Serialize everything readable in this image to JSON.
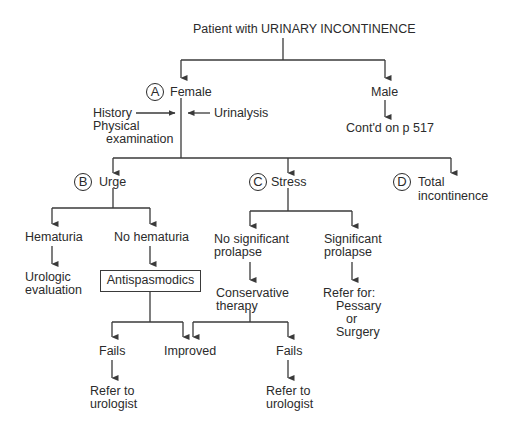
{
  "title": "Patient with URINARY INCONTINENCE",
  "branches": {
    "female": {
      "marker": "A",
      "label": "Female"
    },
    "male": {
      "label": "Male",
      "continued": "Cont'd on p 517"
    }
  },
  "workup": {
    "left_line1": "History",
    "left_line2": "Physical",
    "left_line3": "examination",
    "right": "Urinalysis"
  },
  "types": {
    "urge": {
      "marker": "B",
      "label": "Urge"
    },
    "stress": {
      "marker": "C",
      "label": "Stress"
    },
    "total": {
      "marker": "D",
      "label_line1": "Total",
      "label_line2": "incontinence"
    }
  },
  "urge_path": {
    "hematuria": "Hematuria",
    "hematuria_next_line1": "Urologic",
    "hematuria_next_line2": "evaluation",
    "no_hematuria": "No hematuria",
    "treatment": "Antispasmodics",
    "fails": "Fails",
    "fails_next_line1": "Refer to",
    "fails_next_line2": "urologist"
  },
  "shared": {
    "improved": "Improved"
  },
  "stress_path": {
    "no_prolapse_line1": "No significant",
    "no_prolapse_line2": "prolapse",
    "conservative_line1": "Conservative",
    "conservative_line2": "therapy",
    "prolapse_line1": "Significant",
    "prolapse_line2": "prolapse",
    "refer_line1": "Refer for:",
    "refer_line2": "Pessary",
    "refer_line3": "or",
    "refer_line4": "Surgery",
    "fails": "Fails",
    "fails_next_line1": "Refer to",
    "fails_next_line2": "urologist"
  }
}
